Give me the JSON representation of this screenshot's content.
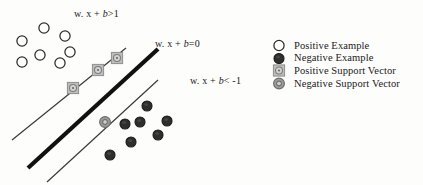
{
  "figure": {
    "width": 423,
    "height": 185,
    "background": "#fdfdfc"
  },
  "colors": {
    "line": "#3a3a3a",
    "hyperplane": "#111111",
    "positive_fill": "#ffffff",
    "positive_stroke": "#2b2b2b",
    "negative_fill": "#2e2e2e",
    "negative_stroke": "#1a1a1a",
    "positive_sv_fill": "#bdbdbd",
    "positive_sv_stroke": "#8f8f8f",
    "negative_sv_fill": "#9a9a9a",
    "negative_sv_stroke": "#6e6e6e",
    "text": "#1a1a1a"
  },
  "equations": {
    "margin_positive": {
      "prefix": "w. x + ",
      "variable": "b",
      "suffix": ">1"
    },
    "hyperplane": {
      "prefix": "w. x + ",
      "variable": "b",
      "suffix": "=0"
    },
    "margin_negative": {
      "prefix": "w. x + ",
      "variable": "b",
      "suffix": "< -1"
    }
  },
  "legend": {
    "items": [
      {
        "marker": "open-circle-icon",
        "label": "Positive Example"
      },
      {
        "marker": "filled-circle-icon",
        "label": "Negative Example"
      },
      {
        "marker": "square-support-vector-icon",
        "label": "Positive Support Vector"
      },
      {
        "marker": "ring-support-vector-icon",
        "label": "Negative Support Vector"
      }
    ]
  },
  "chart_data": {
    "type": "scatter",
    "xlabel": "",
    "ylabel": "",
    "xlim": [
      0,
      423
    ],
    "ylim": [
      0,
      185
    ],
    "grid": false,
    "legend_position": "right",
    "annotations": [
      {
        "text": "w. x + b>1",
        "x": 74,
        "y": 8,
        "name": "margin-positive-equation"
      },
      {
        "text": "w. x + b=0",
        "x": 155,
        "y": 38,
        "name": "hyperplane-equation"
      },
      {
        "text": "w. x + b< -1",
        "x": 190,
        "y": 75,
        "name": "margin-negative-equation"
      }
    ],
    "lines": [
      {
        "name": "positive-margin-line",
        "x1": 12,
        "y1": 140,
        "x2": 126,
        "y2": 48,
        "width": 1.2,
        "color": "#3a3a3a"
      },
      {
        "name": "decision-boundary",
        "x1": 28,
        "y1": 168,
        "x2": 158,
        "y2": 49,
        "width": 4.2,
        "color": "#111111"
      },
      {
        "name": "negative-margin-line",
        "x1": 47,
        "y1": 182,
        "x2": 158,
        "y2": 80,
        "width": 1.2,
        "color": "#3a3a3a"
      }
    ],
    "series": [
      {
        "name": "Positive Example",
        "marker": "open-circle",
        "points": [
          [
            22,
            41
          ],
          [
            44,
            28
          ],
          [
            65,
            36
          ],
          [
            40,
            55
          ],
          [
            70,
            52
          ],
          [
            22,
            62
          ],
          [
            60,
            63
          ]
        ]
      },
      {
        "name": "Negative Example",
        "marker": "filled-circle",
        "points": [
          [
            147,
            106
          ],
          [
            125,
            124
          ],
          [
            140,
            122
          ],
          [
            167,
            121
          ],
          [
            131,
            142
          ],
          [
            158,
            135
          ],
          [
            110,
            155
          ]
        ]
      },
      {
        "name": "Positive Support Vector",
        "marker": "square-support-vector",
        "points": [
          [
            73,
            88
          ],
          [
            98,
            70
          ],
          [
            117,
            58
          ]
        ]
      },
      {
        "name": "Negative Support Vector",
        "marker": "ring-support-vector",
        "points": [
          [
            105,
            122
          ]
        ]
      }
    ]
  }
}
